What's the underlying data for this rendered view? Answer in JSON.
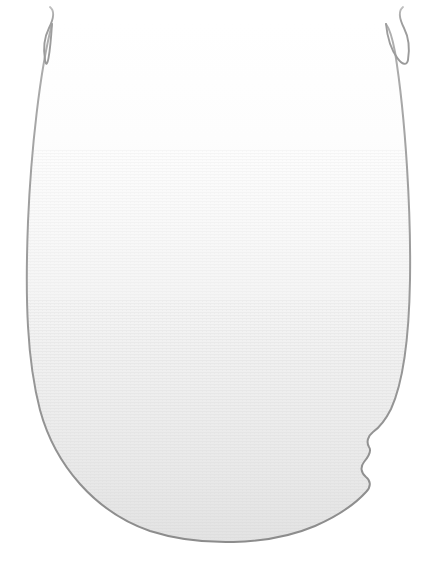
{
  "figure": {
    "title": "Specimen outline illustration",
    "caption": "",
    "background_color": "#ffffff",
    "canvas": {
      "width": 438,
      "height": 566
    }
  },
  "colors": {
    "background": "#ffffff",
    "outline_stroke": "#9a9a9a",
    "outline_stroke_dark": "#8a8a8a",
    "midline_stroke": "#b8b8b8",
    "fill_top": "#ffffff",
    "fill_middle": "#f7f7f7",
    "fill_lower": "#ececec",
    "fill_bottom": "#e4e4e4",
    "texture": "#dcdcdc"
  },
  "strokes": {
    "outline_width": 2.0,
    "midline_width": 1.3,
    "antenna_width": 1.9
  },
  "geometry": {
    "body": {
      "name": "body-outline",
      "top_y": 8,
      "bottom_y": 543,
      "left_extreme_x": 27,
      "left_extreme_y": 258,
      "right_extreme_x": 411,
      "right_extreme_y": 262,
      "center_x": 235
    },
    "midline": {
      "name": "midline",
      "x": 235,
      "top_y": 18,
      "bottom_y": 461
    },
    "antenna_left": {
      "name": "antenna-left",
      "tip_x": 50,
      "tip_y": 7
    },
    "antenna_right": {
      "name": "antenna-right",
      "tip_x": 403,
      "tip_y": 7
    },
    "notch": {
      "name": "margin-notch-right",
      "start_y": 424,
      "end_y": 500,
      "bump_count": 2
    }
  },
  "paths": {
    "body_outline": "M 52 24 C 40 70 31 150 28 222 C 25 300 27 360 40 410 C 55 465 95 512 150 531 C 200 547 268 546 315 526 C 340 515 356 503 366 492 C 372 486 370 480 366 477 C 361 473 360 467 364 462 C 369 456 372 451 369 447 C 366 442 368 436 373 432 C 380 427 386 419 391 409 C 402 385 409 340 410 280 C 411 215 406 120 395 52 C 392 36 389 28 386 24",
    "antenna_left": "M 50 7 C 55 11 54 18 49 28 C 44 38 43 48 45 60",
    "antenna_right": "M 403 7 C 398 11 399 18 404 28 C 409 38 410 48 408 60",
    "midline": "M 235 18 L 235 461"
  },
  "labels": {
    "body": "body outline",
    "midline": "midline suture",
    "antenna_left": "left antenna",
    "antenna_right": "right antenna",
    "notch": "right margin notch"
  }
}
